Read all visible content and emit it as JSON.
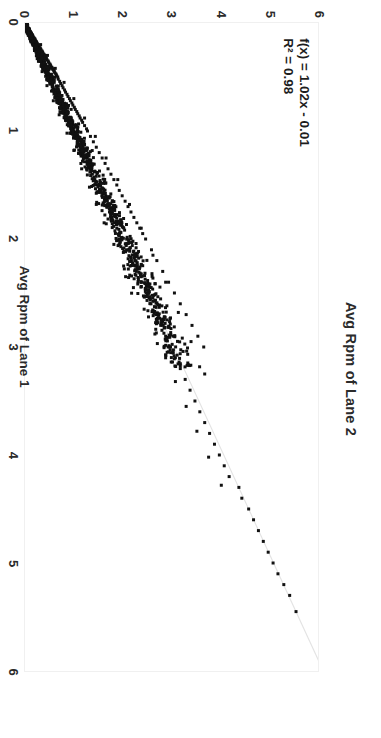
{
  "chart_data": {
    "type": "scatter",
    "title": "Avg Rpm of Lane 2",
    "xlabel": "Avg Rpm of Lane 1",
    "ylabel": "Avg Rpm of Lane 2",
    "xlim": [
      0,
      6
    ],
    "ylim": [
      0,
      6
    ],
    "xticks": [
      0,
      1,
      2,
      3,
      4,
      5,
      6
    ],
    "yticks": [
      0,
      1,
      2,
      3,
      4,
      5,
      6
    ],
    "xtick_labels": [
      "0",
      "1",
      "2",
      "3",
      "4",
      "5",
      "6"
    ],
    "ytick_labels": [
      "0",
      "1",
      "2",
      "3",
      "4",
      "5",
      "6"
    ],
    "grid": false,
    "legend": false,
    "orientation": "rotated-90-clockwise",
    "marker_color": "#111111",
    "trendline_color": "#e3e3e3",
    "annotations": {
      "equation": "f(x) = 1.02x - 0.01",
      "r_squared": "R² = 0.98"
    },
    "fit": {
      "slope": 1.02,
      "intercept": -0.01,
      "r2": 0.98
    },
    "series": [
      {
        "name": "Lane 1 vs Lane 2",
        "points": [
          [
            0.03,
            0.02
          ],
          [
            0.04,
            0.05
          ],
          [
            0.05,
            0.03
          ],
          [
            0.05,
            0.07
          ],
          [
            0.06,
            0.05
          ],
          [
            0.06,
            0.09
          ],
          [
            0.07,
            0.04
          ],
          [
            0.07,
            0.08
          ],
          [
            0.08,
            0.06
          ],
          [
            0.08,
            0.11
          ],
          [
            0.09,
            0.07
          ],
          [
            0.09,
            0.12
          ],
          [
            0.1,
            0.08
          ],
          [
            0.1,
            0.13
          ],
          [
            0.11,
            0.09
          ],
          [
            0.11,
            0.15
          ],
          [
            0.12,
            0.1
          ],
          [
            0.12,
            0.16
          ],
          [
            0.13,
            0.11
          ],
          [
            0.13,
            0.17
          ],
          [
            0.14,
            0.12
          ],
          [
            0.14,
            0.19
          ],
          [
            0.15,
            0.13
          ],
          [
            0.15,
            0.2
          ],
          [
            0.16,
            0.14
          ],
          [
            0.16,
            0.21
          ],
          [
            0.17,
            0.15
          ],
          [
            0.17,
            0.23
          ],
          [
            0.18,
            0.16
          ],
          [
            0.18,
            0.24
          ],
          [
            0.19,
            0.17
          ],
          [
            0.19,
            0.25
          ],
          [
            0.2,
            0.18
          ],
          [
            0.2,
            0.27
          ],
          [
            0.21,
            0.19
          ],
          [
            0.21,
            0.28
          ],
          [
            0.22,
            0.2
          ],
          [
            0.22,
            0.29
          ],
          [
            0.23,
            0.21
          ],
          [
            0.23,
            0.31
          ],
          [
            0.24,
            0.22
          ],
          [
            0.24,
            0.32
          ],
          [
            0.25,
            0.23
          ],
          [
            0.25,
            0.33
          ],
          [
            0.26,
            0.24
          ],
          [
            0.26,
            0.35
          ],
          [
            0.27,
            0.25
          ],
          [
            0.27,
            0.36
          ],
          [
            0.28,
            0.26
          ],
          [
            0.28,
            0.37
          ],
          [
            0.29,
            0.27
          ],
          [
            0.29,
            0.39
          ],
          [
            0.3,
            0.28
          ],
          [
            0.3,
            0.4
          ],
          [
            0.31,
            0.29
          ],
          [
            0.31,
            0.41
          ],
          [
            0.32,
            0.3
          ],
          [
            0.32,
            0.43
          ],
          [
            0.33,
            0.31
          ],
          [
            0.33,
            0.44
          ],
          [
            0.34,
            0.32
          ],
          [
            0.34,
            0.45
          ],
          [
            0.35,
            0.33
          ],
          [
            0.35,
            0.47
          ],
          [
            0.36,
            0.34
          ],
          [
            0.36,
            0.48
          ],
          [
            0.37,
            0.35
          ],
          [
            0.37,
            0.49
          ],
          [
            0.38,
            0.36
          ],
          [
            0.38,
            0.51
          ],
          [
            0.39,
            0.37
          ],
          [
            0.39,
            0.52
          ],
          [
            0.4,
            0.38
          ],
          [
            0.4,
            0.53
          ],
          [
            0.41,
            0.39
          ],
          [
            0.41,
            0.55
          ],
          [
            0.42,
            0.4
          ],
          [
            0.42,
            0.56
          ],
          [
            0.43,
            0.41
          ],
          [
            0.43,
            0.57
          ],
          [
            0.44,
            0.42
          ],
          [
            0.44,
            0.59
          ],
          [
            0.45,
            0.43
          ],
          [
            0.45,
            0.6
          ],
          [
            0.46,
            0.44
          ],
          [
            0.46,
            0.61
          ],
          [
            0.47,
            0.45
          ],
          [
            0.47,
            0.63
          ],
          [
            0.48,
            0.46
          ],
          [
            0.48,
            0.64
          ],
          [
            0.49,
            0.47
          ],
          [
            0.49,
            0.65
          ],
          [
            0.5,
            0.48
          ],
          [
            0.5,
            0.67
          ],
          [
            0.52,
            0.5
          ],
          [
            0.52,
            0.68
          ],
          [
            0.54,
            0.52
          ],
          [
            0.54,
            0.71
          ],
          [
            0.56,
            0.54
          ],
          [
            0.56,
            0.73
          ],
          [
            0.58,
            0.56
          ],
          [
            0.58,
            0.76
          ],
          [
            0.6,
            0.58
          ],
          [
            0.6,
            0.78
          ],
          [
            0.62,
            0.6
          ],
          [
            0.62,
            0.81
          ],
          [
            0.64,
            0.62
          ],
          [
            0.64,
            0.83
          ],
          [
            0.66,
            0.64
          ],
          [
            0.66,
            0.86
          ],
          [
            0.68,
            0.66
          ],
          [
            0.68,
            0.88
          ],
          [
            0.7,
            0.68
          ],
          [
            0.7,
            0.91
          ],
          [
            0.72,
            0.7
          ],
          [
            0.72,
            0.93
          ],
          [
            0.74,
            0.72
          ],
          [
            0.74,
            0.96
          ],
          [
            0.76,
            0.74
          ],
          [
            0.76,
            0.98
          ],
          [
            0.78,
            0.76
          ],
          [
            0.78,
            1.01
          ],
          [
            0.8,
            0.78
          ],
          [
            0.8,
            1.03
          ],
          [
            0.82,
            0.8
          ],
          [
            0.82,
            1.06
          ],
          [
            0.84,
            0.82
          ],
          [
            0.84,
            1.08
          ],
          [
            0.86,
            0.84
          ],
          [
            0.86,
            1.11
          ],
          [
            0.88,
            0.86
          ],
          [
            0.88,
            1.13
          ],
          [
            0.9,
            0.88
          ],
          [
            0.9,
            1.16
          ],
          [
            0.92,
            0.9
          ],
          [
            0.92,
            1.18
          ],
          [
            0.95,
            0.93
          ],
          [
            0.95,
            1.22
          ],
          [
            0.98,
            0.96
          ],
          [
            0.98,
            1.26
          ],
          [
            1.0,
            0.98
          ],
          [
            1.0,
            1.28
          ],
          [
            1.05,
            1.03
          ],
          [
            1.05,
            1.34
          ],
          [
            1.1,
            1.08
          ],
          [
            1.1,
            1.4
          ],
          [
            1.15,
            1.13
          ],
          [
            1.15,
            1.46
          ],
          [
            1.2,
            1.18
          ],
          [
            1.2,
            1.52
          ],
          [
            1.25,
            1.23
          ],
          [
            1.25,
            1.58
          ],
          [
            1.3,
            1.28
          ],
          [
            1.3,
            1.64
          ],
          [
            1.35,
            1.33
          ],
          [
            1.35,
            1.7
          ],
          [
            1.4,
            1.38
          ],
          [
            1.4,
            1.76
          ],
          [
            1.45,
            1.43
          ],
          [
            1.45,
            1.82
          ],
          [
            1.5,
            1.48
          ],
          [
            1.5,
            1.88
          ],
          [
            1.55,
            1.53
          ],
          [
            1.55,
            1.93
          ],
          [
            1.6,
            1.58
          ],
          [
            1.6,
            1.99
          ],
          [
            1.65,
            1.63
          ],
          [
            1.65,
            2.05
          ],
          [
            1.7,
            1.68
          ],
          [
            1.7,
            2.11
          ],
          [
            1.75,
            1.73
          ],
          [
            1.75,
            2.17
          ],
          [
            1.8,
            1.78
          ],
          [
            1.8,
            2.23
          ],
          [
            1.85,
            1.83
          ],
          [
            1.85,
            2.29
          ],
          [
            1.9,
            1.88
          ],
          [
            1.9,
            2.35
          ],
          [
            1.95,
            1.93
          ],
          [
            1.95,
            2.41
          ],
          [
            2.0,
            1.98
          ],
          [
            2.0,
            2.47
          ],
          [
            2.1,
            2.08
          ],
          [
            2.1,
            2.59
          ],
          [
            2.2,
            2.18
          ],
          [
            2.2,
            2.7
          ],
          [
            2.3,
            2.28
          ],
          [
            2.3,
            2.82
          ],
          [
            2.4,
            2.38
          ],
          [
            2.4,
            2.94
          ],
          [
            2.5,
            2.48
          ],
          [
            2.5,
            3.06
          ],
          [
            2.6,
            2.58
          ],
          [
            2.6,
            3.18
          ],
          [
            2.7,
            2.68
          ],
          [
            2.7,
            3.3
          ],
          [
            2.8,
            2.78
          ],
          [
            2.8,
            3.42
          ],
          [
            2.9,
            2.88
          ],
          [
            2.9,
            3.54
          ],
          [
            3.0,
            2.98
          ],
          [
            3.0,
            3.66
          ],
          [
            3.1,
            3.08
          ],
          [
            3.2,
            3.18
          ],
          [
            3.3,
            3.28
          ],
          [
            3.4,
            3.38
          ],
          [
            3.5,
            3.48
          ],
          [
            3.6,
            3.58
          ],
          [
            3.7,
            3.68
          ],
          [
            3.8,
            3.78
          ],
          [
            3.9,
            3.88
          ],
          [
            4.0,
            3.98
          ],
          [
            4.1,
            4.08
          ],
          [
            4.2,
            4.18
          ],
          [
            4.3,
            4.38
          ],
          [
            4.4,
            4.44
          ],
          [
            4.5,
            4.58
          ],
          [
            4.6,
            4.68
          ],
          [
            4.7,
            4.78
          ],
          [
            4.8,
            4.88
          ],
          [
            4.9,
            4.98
          ],
          [
            5.0,
            5.08
          ],
          [
            5.1,
            5.18
          ],
          [
            5.2,
            5.3
          ],
          [
            5.3,
            5.42
          ],
          [
            5.45,
            5.55
          ],
          [
            0.33,
            0.25
          ],
          [
            0.45,
            0.35
          ],
          [
            0.58,
            0.45
          ],
          [
            0.72,
            0.58
          ],
          [
            0.85,
            0.7
          ],
          [
            1.02,
            0.86
          ],
          [
            1.18,
            1.0
          ],
          [
            1.35,
            1.16
          ],
          [
            1.52,
            1.32
          ],
          [
            1.68,
            1.46
          ],
          [
            1.85,
            1.62
          ],
          [
            2.05,
            1.82
          ],
          [
            2.25,
            2.02
          ],
          [
            2.45,
            2.22
          ],
          [
            2.65,
            2.44
          ],
          [
            2.88,
            2.66
          ],
          [
            3.1,
            2.88
          ],
          [
            3.32,
            3.08
          ],
          [
            3.55,
            3.3
          ],
          [
            3.78,
            3.52
          ],
          [
            4.02,
            3.76
          ],
          [
            4.28,
            4.02
          ],
          [
            0.2,
            0.32
          ],
          [
            0.3,
            0.46
          ],
          [
            0.42,
            0.62
          ],
          [
            0.55,
            0.8
          ],
          [
            0.7,
            1.0
          ],
          [
            0.88,
            1.22
          ],
          [
            1.05,
            1.44
          ],
          [
            1.25,
            1.66
          ],
          [
            1.45,
            1.9
          ],
          [
            1.68,
            2.14
          ],
          [
            1.9,
            2.38
          ],
          [
            2.15,
            2.62
          ],
          [
            2.4,
            2.88
          ],
          [
            2.68,
            3.14
          ],
          [
            2.95,
            3.4
          ],
          [
            3.25,
            3.68
          ]
        ]
      }
    ]
  },
  "figure": {
    "title": "Avg Rpm of Lane 2",
    "x_axis_title": "Avg Rpm of Lane 1",
    "equation_line1": "f(x) = 1.02x - 0.01",
    "equation_line2": "R² = 0.98"
  }
}
